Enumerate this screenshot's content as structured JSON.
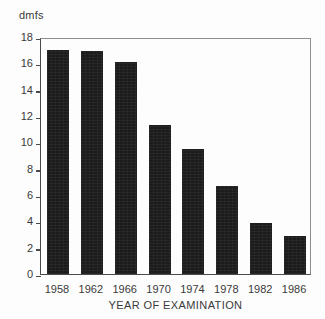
{
  "chart_data": {
    "type": "bar",
    "title": "",
    "subtitle": "",
    "xlabel": "YEAR OF EXAMINATION",
    "ylabel": "dmfs",
    "categories": [
      "1958",
      "1962",
      "1966",
      "1970",
      "1974",
      "1978",
      "1982",
      "1986"
    ],
    "values": [
      17.0,
      16.9,
      16.1,
      11.3,
      9.5,
      6.7,
      3.9,
      2.9
    ],
    "ylim": [
      0,
      18
    ],
    "yticks": [
      0,
      2,
      4,
      6,
      8,
      10,
      12,
      14,
      16,
      18
    ],
    "ytick_labels": [
      "0",
      "2",
      "4",
      "6",
      "8",
      "10",
      "12",
      "14",
      "16",
      "18"
    ],
    "grid": false,
    "legend": null,
    "bar_color": "#1c1c1c",
    "axis_color": "#4a4a4a",
    "background": "#fdfdfd",
    "annotations": []
  }
}
